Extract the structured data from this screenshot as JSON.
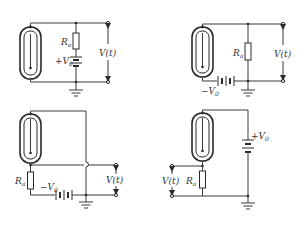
{
  "figure": {
    "circuits": [
      {
        "id": "a",
        "resistor_label": "R",
        "resistor_sub": "a",
        "battery_label": "+V",
        "battery_sub": "0",
        "output_label": "V(t)"
      },
      {
        "id": "b",
        "resistor_label": "R",
        "resistor_sub": "a",
        "battery_label": "−V",
        "battery_sub": "0",
        "output_label": "V(t)"
      },
      {
        "id": "c",
        "resistor_label": "R",
        "resistor_sub": "a",
        "battery_label": "−V",
        "battery_sub": "0",
        "output_label": "V(t)"
      },
      {
        "id": "d",
        "resistor_label": "R",
        "resistor_sub": "a",
        "battery_label": "+V",
        "battery_sub": "0",
        "output_label": "V(t)"
      }
    ],
    "colors": {
      "line": "#3a3a3a",
      "background": "#ffffff"
    }
  }
}
